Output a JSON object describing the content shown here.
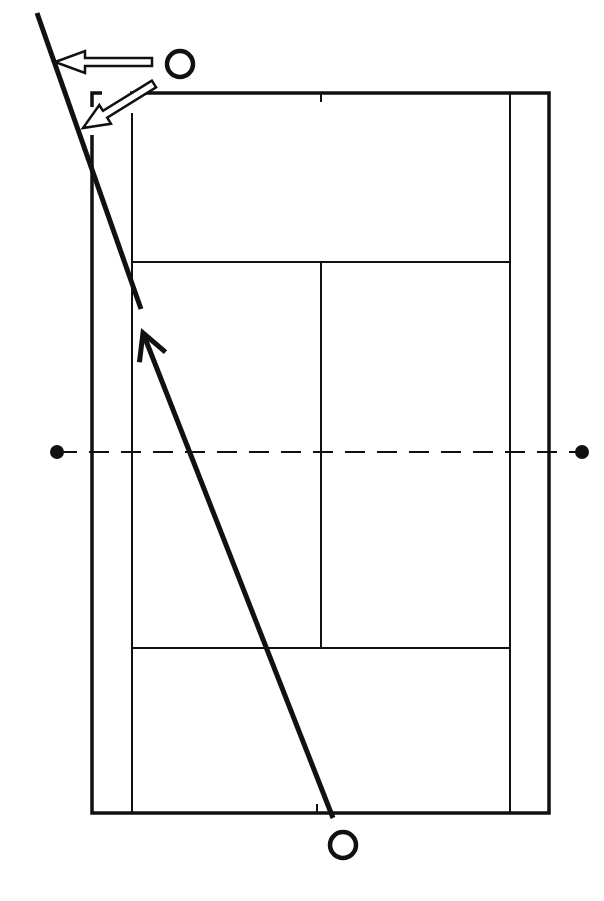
{
  "diagram": {
    "type": "tennis-court-shot-diagram",
    "colors": {
      "background": "#ffffff",
      "ink": "#111111"
    },
    "court": {
      "outer": {
        "x1": 92,
        "y1": 93,
        "x2": 549,
        "y2": 813
      },
      "singles_left_x": 132,
      "singles_right_x": 510,
      "service_line_top_y": 262,
      "service_line_bottom_y": 648,
      "center_line_x": 321,
      "net_y": 452,
      "net_posts": [
        {
          "x": 57,
          "y": 452
        },
        {
          "x": 582,
          "y": 452
        }
      ]
    },
    "players": [
      {
        "name": "player-top",
        "x": 180,
        "y": 64,
        "r": 13
      },
      {
        "name": "player-bottom",
        "x": 343,
        "y": 845,
        "r": 13
      }
    ],
    "shot": {
      "label": "ball trajectory",
      "from": {
        "x": 333,
        "y": 818
      },
      "to": {
        "x": 143,
        "y": 333
      }
    },
    "extension_line": {
      "from": {
        "x": 37,
        "y": 13
      },
      "to": {
        "x": 141,
        "y": 309
      }
    },
    "movement_arrows": [
      {
        "name": "move-left-arrow",
        "from": {
          "x": 152,
          "y": 62
        },
        "to": {
          "x": 55,
          "y": 62
        }
      },
      {
        "name": "move-diagonal-arrow",
        "from": {
          "x": 154,
          "y": 84
        },
        "to": {
          "x": 83,
          "y": 128
        }
      }
    ]
  }
}
